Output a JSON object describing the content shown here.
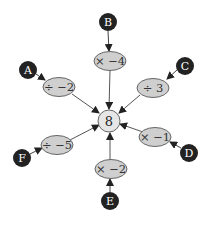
{
  "colors": {
    "background": "#ffffff",
    "letter_node": "#222222",
    "letter_text": "#ffffff",
    "operation_fill": "#cfcfcf",
    "center_fill": "#e6e6e6",
    "stroke": "#555555",
    "arrow": "#333333"
  },
  "diagram": {
    "center": {
      "label": "8"
    },
    "branches": [
      {
        "letter": "A",
        "operation": "÷ −2"
      },
      {
        "letter": "B",
        "operation": "× −4"
      },
      {
        "letter": "C",
        "operation": "÷ 3"
      },
      {
        "letter": "D",
        "operation": "× −1"
      },
      {
        "letter": "E",
        "operation": "× −2"
      },
      {
        "letter": "F",
        "operation": "÷ −5"
      }
    ]
  }
}
